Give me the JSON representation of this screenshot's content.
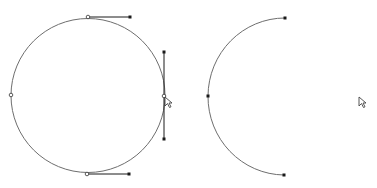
{
  "canvas": {
    "width": 377,
    "height": 188,
    "background": "#ffffff"
  },
  "colors": {
    "path": "#6e6e6e",
    "handle_line": "#1a1a1a",
    "anchor_fill": "#1a1a1a",
    "anchor_hollow_fill": "#ffffff",
    "anchor_hollow_stroke": "#333333",
    "cursor": "#444444"
  },
  "shapes": [
    {
      "name": "full-circle-path",
      "type": "circle",
      "cx": 88,
      "cy": 95.5,
      "r": 77,
      "selected": true,
      "anchors": [
        {
          "name": "anchor-top",
          "x": 88,
          "y": 17,
          "style": "hollow",
          "handle": {
            "x": 130,
            "y": 17
          }
        },
        {
          "name": "anchor-right",
          "x": 164,
          "y": 96,
          "style": "hollow",
          "handle_a": {
            "x": 164,
            "y": 52
          },
          "handle_b": {
            "x": 164,
            "y": 139
          }
        },
        {
          "name": "anchor-bottom",
          "x": 87,
          "y": 174,
          "style": "hollow",
          "handle": {
            "x": 129,
            "y": 174
          }
        },
        {
          "name": "anchor-left",
          "x": 11,
          "y": 95,
          "style": "hollow"
        }
      ]
    },
    {
      "name": "half-circle-path",
      "type": "arc",
      "start": {
        "x": 285,
        "y": 18
      },
      "mid": {
        "x": 208,
        "y": 96
      },
      "end": {
        "x": 284,
        "y": 175
      },
      "anchors": [
        {
          "name": "anchor-start",
          "x": 285,
          "y": 18,
          "style": "filled"
        },
        {
          "name": "anchor-mid",
          "x": 208,
          "y": 96,
          "style": "filled"
        },
        {
          "name": "anchor-end",
          "x": 284,
          "y": 175,
          "style": "filled"
        }
      ]
    }
  ],
  "cursors": [
    {
      "name": "direct-select-cursor-left",
      "x": 165,
      "y": 97
    },
    {
      "name": "direct-select-cursor-right",
      "x": 359,
      "y": 97
    }
  ]
}
